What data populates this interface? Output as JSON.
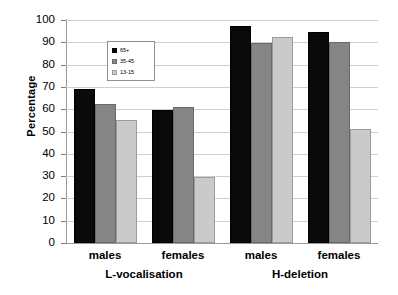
{
  "chart_data": {
    "type": "bar",
    "title": "",
    "xlabel": "",
    "ylabel": "Percentage",
    "ylim": [
      0,
      100
    ],
    "ytick_step": 10,
    "yticks": [
      100,
      90,
      80,
      70,
      60,
      50,
      40,
      30,
      20,
      10,
      0
    ],
    "grid": true,
    "legend_position": "top-left-inside",
    "categories": [
      "males",
      "females",
      "males",
      "females"
    ],
    "groups": [
      {
        "label": "L-vocalisation",
        "categories": [
          "males",
          "females"
        ]
      },
      {
        "label": "H-deletion",
        "categories": [
          "males",
          "females"
        ]
      }
    ],
    "series": [
      {
        "name": "65+",
        "color": "#0a0a0a",
        "values": [
          69,
          59.5,
          97.5,
          94.5
        ]
      },
      {
        "name": "35-45",
        "color": "#858585",
        "values": [
          62.5,
          61,
          89.5,
          90
        ]
      },
      {
        "name": "13-15",
        "color": "#cacaca",
        "values": [
          55,
          29.5,
          92.5,
          51
        ]
      }
    ]
  },
  "axis": {
    "y_title": "Percentage"
  },
  "legend": {
    "items": [
      {
        "label": "65+"
      },
      {
        "label": "35-45"
      },
      {
        "label": "13-15"
      }
    ]
  },
  "xaxis": {
    "category_labels": [
      "males",
      "females",
      "males",
      "females"
    ],
    "group_labels": [
      "L-vocalisation",
      "H-deletion"
    ]
  }
}
